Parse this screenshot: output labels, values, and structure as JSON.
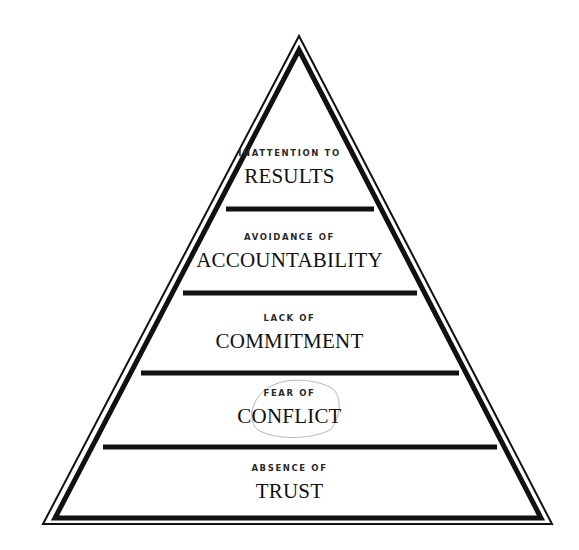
{
  "diagram": {
    "type": "pyramid",
    "levels": [
      {
        "prefix": "INATTENTION TO",
        "title": "RESULTS"
      },
      {
        "prefix": "AVOIDANCE OF",
        "title": "ACCOUNTABILITY"
      },
      {
        "prefix": "LACK OF",
        "title": "COMMITMENT"
      },
      {
        "prefix": "FEAR OF",
        "title": "CONFLICT",
        "annotation": "hand-drawn circle"
      },
      {
        "prefix": "ABSENCE OF",
        "title": "TRUST"
      }
    ],
    "colors": {
      "stroke": "#111111",
      "background": "#ffffff",
      "annotation": "#b8b8b8"
    }
  }
}
